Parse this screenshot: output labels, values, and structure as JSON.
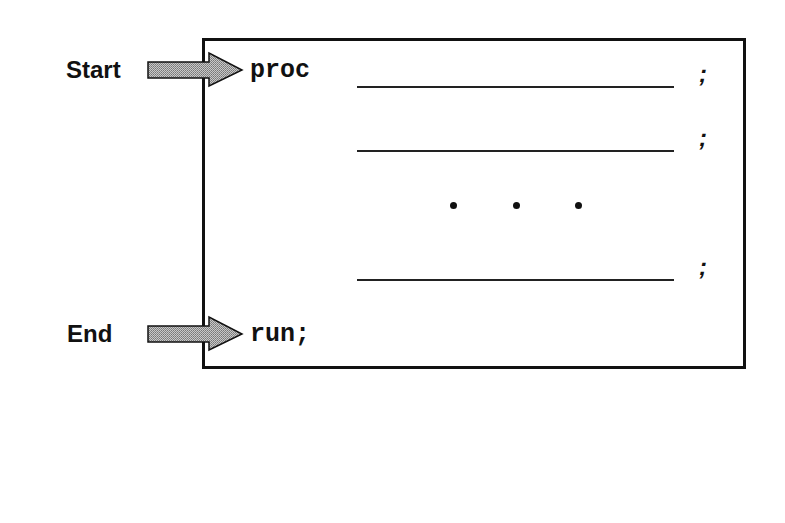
{
  "diagram": {
    "start_label": "Start",
    "end_label": "End",
    "proc_keyword": "proc",
    "run_statement": "run;",
    "statement_terminator": ";",
    "ellipsis": ". . .",
    "statements": [
      {
        "blank": "",
        "terminator": ";"
      },
      {
        "blank": "",
        "terminator": ";"
      },
      {
        "blank": "",
        "terminator": ";"
      }
    ],
    "colors": {
      "arrow_fill": "#a8a8a8",
      "stroke": "#111111",
      "background": "#ffffff"
    }
  }
}
